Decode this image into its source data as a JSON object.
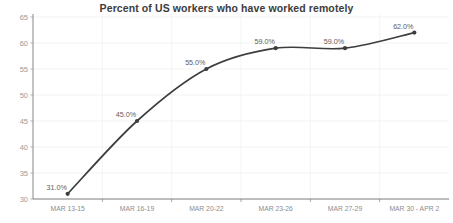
{
  "chart_data": {
    "type": "line",
    "title": "Percent of US workers who have worked remotely",
    "xlabel": "",
    "ylabel": "",
    "categories": [
      "MAR 13-15",
      "MAR 16-19",
      "MAR 20-22",
      "MAR 23-26",
      "MAR 27-29",
      "MAR 30 - APR 2"
    ],
    "values": [
      31.0,
      45.0,
      55.0,
      59.0,
      59.0,
      62.0
    ],
    "point_labels": [
      "31.0%",
      "45.0%",
      "55.0%",
      "59.0%",
      "59.0%",
      "62.0%"
    ],
    "ylim": [
      30,
      65
    ],
    "yticks": [
      30,
      35,
      40,
      45,
      50,
      55,
      60,
      65
    ],
    "ytick_labels": [
      "30",
      "35",
      "40",
      "45",
      "50",
      "55",
      "60",
      "65"
    ],
    "grid": true,
    "legend": false,
    "line_color": "#3d3d3d",
    "marker_color": "#3d3d3d",
    "title_color": "#3c3c3c",
    "gridline_color": "#eeeeee",
    "axis_color": "#6e6e6e",
    "tick_label_color": "#9a9a9a",
    "smoothing": "spline"
  }
}
